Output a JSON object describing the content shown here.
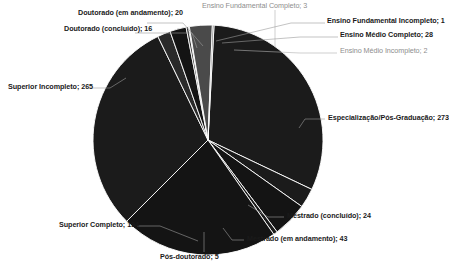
{
  "chart_data": {
    "type": "pie",
    "title": "",
    "subtitle": "",
    "xlabel": "",
    "ylabel": "",
    "legend_position": "none",
    "grid": false,
    "label_format": "category; value",
    "total": 874,
    "categories": [
      "Especialização/Pós-Graduação",
      "Mestrado (concluído)",
      "Mestrado (em andamento)",
      "Pós-doutorado",
      "Superior Completo",
      "Superior Incompleto",
      "Doutorado (concluído)",
      "Doutorado (em andamento)",
      "Ensino Fundamental Completo",
      "Ensino Fundamental Incompleto",
      "Ensino Médio Completo",
      "Ensino Médio Incompleto"
    ],
    "values": [
      273,
      24,
      43,
      5,
      194,
      265,
      16,
      20,
      3,
      1,
      28,
      2
    ],
    "slices": [
      {
        "label": "Especialização/Pós-Graduação",
        "value": 273,
        "color": "#1b1b1b"
      },
      {
        "label": "Mestrado (concluído)",
        "value": 24,
        "color": "#1b1b1b"
      },
      {
        "label": "Mestrado (em andamento)",
        "value": 43,
        "color": "#141414"
      },
      {
        "label": "Pós-doutorado",
        "value": 5,
        "color": "#1b1b1b"
      },
      {
        "label": "Superior Completo",
        "value": 194,
        "color": "#141414"
      },
      {
        "label": "Superior Incompleto",
        "value": 265,
        "color": "#1b1b1b"
      },
      {
        "label": "Doutorado (concluído)",
        "value": 16,
        "color": "#2a2a2a"
      },
      {
        "label": "Doutorado (em andamento)",
        "value": 20,
        "color": "#141414"
      },
      {
        "label": "Ensino Fundamental Completo",
        "value": 3,
        "color": "#3a3a3a"
      },
      {
        "label": "Ensino Fundamental Incompleto",
        "value": 1,
        "color": "#6f6f6f"
      },
      {
        "label": "Ensino Médio Completo",
        "value": 28,
        "color": "#4a4a4a"
      },
      {
        "label": "Ensino Médio Incompleto",
        "value": 2,
        "color": "#6f6f6f"
      }
    ]
  },
  "labels": {
    "doutorado_andamento": "Doutorado (em andamento); 20",
    "doutorado_concluido": "Doutorado (concluído); 16",
    "ensino_fund_completo": "Ensino Fundamental Completo; 3",
    "ensino_fund_incompleto": "Ensino Fundamental Incompleto; 1",
    "ensino_medio_completo": "Ensino Médio Completo; 28",
    "ensino_medio_incompleto": "Ensino Médio Incompleto; 2",
    "superior_incompleto": "Superior Incompleto; 265",
    "especializacao": "Especialização/Pós-Graduação; 273",
    "mestrado_concluido": "Mestrado (concluído); 24",
    "mestrado_andamento": "Mestrado (em andamento); 43",
    "superior_completo": "Superior Completo; 194",
    "pos_doutorado": "Pós-doutorado; 5"
  }
}
